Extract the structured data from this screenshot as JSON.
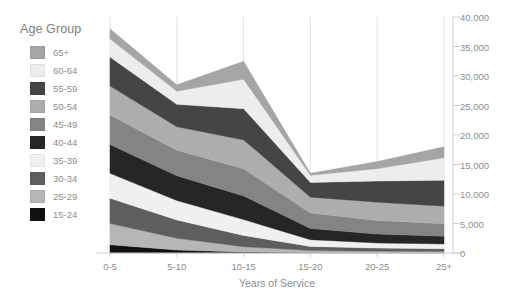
{
  "chart_data": {
    "type": "area",
    "title": "",
    "subtitle": "",
    "xlabel": "Years of Service",
    "ylabel": "",
    "legend_title": "Age Group",
    "legend_position": "left",
    "grid": "vertical",
    "yaxis_position": "right",
    "stacked": true,
    "categories": [
      "0-5",
      "5-10",
      "10-15",
      "15-20",
      "20-25",
      "25+"
    ],
    "ylim": [
      0,
      40000
    ],
    "yticks": [
      0,
      5000,
      10000,
      15000,
      20000,
      25000,
      30000,
      35000,
      40000
    ],
    "ytick_labels": [
      "0",
      "5,000",
      "10,000",
      "15,000",
      "20,000",
      "25,000",
      "30,000",
      "35,000",
      "40,000"
    ],
    "series": [
      {
        "name": "15-24",
        "color": "#101010",
        "values": [
          1400,
          500,
          170,
          80,
          60,
          50
        ]
      },
      {
        "name": "25-29",
        "color": "#b6b6b6",
        "values": [
          3600,
          2000,
          900,
          330,
          250,
          220
        ]
      },
      {
        "name": "30-34",
        "color": "#5e5e5e",
        "values": [
          4300,
          3100,
          1900,
          700,
          520,
          470
        ]
      },
      {
        "name": "35-39",
        "color": "#f0f0f0",
        "values": [
          4200,
          3300,
          2700,
          1150,
          870,
          800
        ]
      },
      {
        "name": "40-44",
        "color": "#262626",
        "values": [
          4900,
          4200,
          4000,
          1900,
          1500,
          1300
        ]
      },
      {
        "name": "45-49",
        "color": "#848484",
        "values": [
          5000,
          4300,
          4600,
          2600,
          2300,
          2100
        ]
      },
      {
        "name": "50-54",
        "color": "#adadad",
        "values": [
          4900,
          4000,
          4900,
          2700,
          3100,
          3000
        ]
      },
      {
        "name": "55-59",
        "color": "#454545",
        "values": [
          4900,
          3800,
          5300,
          2500,
          3600,
          4400
        ]
      },
      {
        "name": "60-64",
        "color": "#ededed",
        "values": [
          3100,
          2200,
          5000,
          1200,
          2100,
          3800
        ]
      },
      {
        "name": "65+",
        "color": "#a5a5a5",
        "values": [
          1700,
          1100,
          3030,
          340,
          1200,
          1860
        ]
      }
    ],
    "series_order_bottom_to_top": [
      "15-24",
      "25-29",
      "30-34",
      "35-39",
      "40-44",
      "45-49",
      "50-54",
      "55-59",
      "60-64",
      "65+"
    ],
    "legend_order_top_to_bottom": [
      "65+",
      "60-64",
      "55-59",
      "50-54",
      "45-49",
      "40-44",
      "35-39",
      "30-34",
      "25-29",
      "15-24"
    ],
    "totals": [
      38000,
      28500,
      32500,
      13500,
      15500,
      18000
    ],
    "colors": {
      "axis_text": "#8d8d8d",
      "gridline": "#e2e2e2",
      "baseline": "#cfcfcf",
      "background": "#ffffff"
    }
  },
  "legend": {
    "title": "Age Group",
    "items": [
      {
        "label": "65+",
        "color": "#a5a5a5"
      },
      {
        "label": "60-64",
        "color": "#ededed"
      },
      {
        "label": "55-59",
        "color": "#454545"
      },
      {
        "label": "50-54",
        "color": "#adadad"
      },
      {
        "label": "45-49",
        "color": "#848484"
      },
      {
        "label": "40-44",
        "color": "#262626"
      },
      {
        "label": "35-39",
        "color": "#f0f0f0"
      },
      {
        "label": "30-34",
        "color": "#5e5e5e"
      },
      {
        "label": "25-29",
        "color": "#b6b6b6"
      },
      {
        "label": "15-24",
        "color": "#101010"
      }
    ]
  },
  "axes": {
    "x_title": "Years of Service",
    "x_ticks": [
      "0-5",
      "5-10",
      "10-15",
      "15-20",
      "20-25",
      "25+"
    ],
    "y_ticks": [
      "40,000",
      "35,000",
      "30,000",
      "25,000",
      "20,000",
      "15,000",
      "10,000",
      "5,000",
      "0"
    ]
  }
}
